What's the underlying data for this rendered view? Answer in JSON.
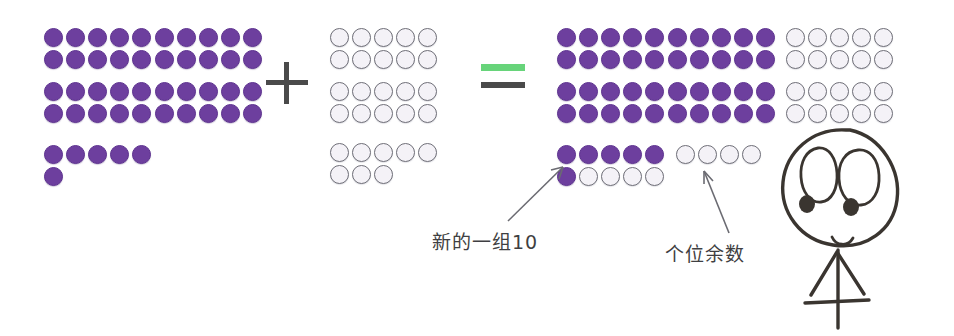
{
  "illustration": {
    "title": "Base-ten counter addition with regrouping",
    "language": "zh"
  },
  "colors": {
    "counter_filled": "#6d3f9e",
    "counter_empty": "#f4f2f7",
    "counter_empty_stroke": "#6f6f78",
    "equals_top_bar": "#67d47a",
    "operator": "#4a4a4a",
    "label_text": "#3f3f42",
    "doodle_ink": "#3a3530",
    "arrow": "#6b6b72",
    "background": "#ffffff"
  },
  "operators": {
    "plus": "+",
    "equals": "="
  },
  "addend_one": {
    "name": "addend-one",
    "total": 46,
    "tens_blocks": [
      {
        "name": "ten-frame-block-1",
        "rows": 4,
        "cols": 5,
        "count": 20,
        "fill": "purple"
      },
      {
        "name": "ten-frame-block-2",
        "rows": 4,
        "cols": 5,
        "count": 20,
        "fill": "purple"
      }
    ],
    "ones": {
      "name": "ones-row",
      "count": 6,
      "fill": "purple",
      "top_row": 5,
      "bottom_row": 1
    }
  },
  "addend_two": {
    "name": "addend-two",
    "total": 28,
    "tens_blocks": [
      {
        "name": "ten-frame-block-1",
        "rows": 4,
        "cols": 5,
        "count": 20,
        "fill": "white"
      }
    ],
    "ones": {
      "name": "ones-row",
      "count": 8,
      "fill": "white",
      "top_row": 5,
      "bottom_row": 3
    }
  },
  "sum": {
    "name": "sum",
    "total": 74,
    "tens_blocks": [
      {
        "name": "ten-frame-block-1",
        "rows": 4,
        "cols": 5,
        "count": 20,
        "fill": "purple"
      },
      {
        "name": "ten-frame-block-2",
        "rows": 4,
        "cols": 5,
        "count": 20,
        "fill": "purple"
      },
      {
        "name": "ten-frame-block-3",
        "rows": 4,
        "cols": 5,
        "count": 20,
        "fill": "white"
      }
    ],
    "new_ten_group": {
      "name": "new-group-of-ten",
      "count": 10,
      "purple": 6,
      "white": 4,
      "top_row": [
        "purple",
        "purple",
        "purple",
        "purple",
        "purple"
      ],
      "bottom_row": [
        "purple",
        "white",
        "white",
        "white",
        "white"
      ]
    },
    "remainder_ones": {
      "name": "remainder-ones",
      "count": 4,
      "fill": "white"
    }
  },
  "labels": {
    "new_group": "新的一组10",
    "remainder": "个位余数"
  },
  "doodle": {
    "name": "hand-drawn-face-figure",
    "description": "stick figure with large eyes and smile"
  }
}
